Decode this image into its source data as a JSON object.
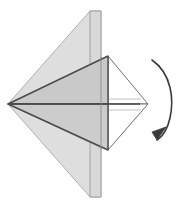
{
  "figure": {
    "canvas": {
      "width": 176,
      "height": 208,
      "background": "#ffffff"
    }
  },
  "palette": {
    "paper_light": "#dedede",
    "paper_mid": "#d2d2d2",
    "paper_dark": "#c6c6c6",
    "paper_shadow": "#bdbdbd",
    "paper_white": "#ffffff",
    "edge_light": "#b0b0b0",
    "edge_mid": "#8a8a8a",
    "edge_dark": "#4a4a4a",
    "crease_line": "#9a9a9a",
    "arrow_stroke": "#3a3a3a"
  },
  "geometry": {
    "apex": {
      "x": 8,
      "y": 104
    },
    "back_flap_top": {
      "x": 90,
      "y": 11
    },
    "back_flap_bottom": {
      "x": 90,
      "y": 197
    },
    "spine_x": 101,
    "front_top_vertex": {
      "x": 108,
      "y": 56
    },
    "front_bottom_vertex": {
      "x": 108,
      "y": 150
    },
    "right_tip": {
      "x": 148,
      "y": 104
    },
    "center_line_y": 104
  },
  "shapes": [
    {
      "name": "back-flap-upper",
      "role": "upper rear paper layer",
      "points": "8,104 90,11 101,11 101,95",
      "fill": "#dedede",
      "stroke": "#b0b0b0"
    },
    {
      "name": "back-flap-lower",
      "role": "lower rear paper layer",
      "points": "8,104 90,197 101,197 101,113",
      "fill": "#dedede",
      "stroke": "#b0b0b0"
    },
    {
      "name": "spine-panel",
      "role": "vertical folded spine panel",
      "points": "90,11 101,11 101,197 90,197",
      "fill": "#d8d8d8",
      "stroke": "#9a9a9a"
    },
    {
      "name": "front-upper-face",
      "role": "upper front folded face",
      "points": "8,104 108,56 108,104",
      "fill": "#c9c9c9",
      "stroke": "#4a4a4a"
    },
    {
      "name": "front-lower-face",
      "role": "lower front folded face",
      "points": "8,104 108,150 108,104",
      "fill": "#cccccc",
      "stroke": "#4a4a4a"
    },
    {
      "name": "right-upper-white-face",
      "role": "upper right white underside",
      "points": "108,56 148,104 108,104",
      "fill": "#ffffff",
      "stroke": "#6f6f6f"
    },
    {
      "name": "right-lower-white-face",
      "role": "lower right white underside",
      "points": "108,150 148,104 108,104",
      "fill": "#ffffff",
      "stroke": "#6f6f6f"
    }
  ],
  "creases": [
    {
      "name": "center-crease",
      "from": "8,104",
      "to": "140,104",
      "stroke": "#4a4a4a",
      "width": 1.6
    },
    {
      "name": "upper-inner-crease",
      "from": "8,104",
      "to": "101,60",
      "stroke": "#b4b4b4",
      "width": 0.9
    },
    {
      "name": "lower-inner-crease",
      "from": "8,104",
      "to": "101,148",
      "stroke": "#b4b4b4",
      "width": 0.9
    },
    {
      "name": "upper-ghost-line",
      "from": "105,99",
      "to": "141,99",
      "stroke": "#c2c2c2",
      "width": 1
    },
    {
      "name": "lower-ghost-line",
      "from": "105,110",
      "to": "141,110",
      "stroke": "#c2c2c2",
      "width": 1
    }
  ],
  "arrow": {
    "name": "rotation-arrow",
    "meaning": "turn the model over",
    "arc_path": "M 152 60 C 172 74 174 100 170 118 C 167 131 162 137 157 140",
    "head_points": "157,140 166,127 152,132",
    "stroke": "#3a3a3a",
    "stroke_width": 1.6
  },
  "labels": {
    "figure_caption": "",
    "step_number": ""
  }
}
